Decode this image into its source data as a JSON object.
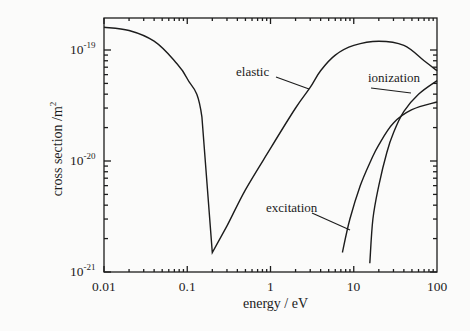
{
  "chart_data": {
    "type": "line",
    "title": "",
    "xlabel": "energy / eV",
    "ylabel": "cross section /m",
    "ylabel_superscript": "2",
    "xscale": "log",
    "yscale": "log",
    "xlim": [
      0.01,
      100
    ],
    "ylim": [
      1e-21,
      1.9e-19
    ],
    "x_ticks": [
      "0.01",
      "0.1",
      "1",
      "10",
      "100"
    ],
    "y_ticks": [
      {
        "base": "10",
        "exp": "-19"
      },
      {
        "base": "10",
        "exp": "-20"
      },
      {
        "base": "10",
        "exp": "-21"
      }
    ],
    "grid": false,
    "legend": "inline annotations",
    "series": [
      {
        "name": "elastic",
        "x": [
          0.01,
          0.02,
          0.04,
          0.07,
          0.1,
          0.15,
          0.2,
          0.3,
          0.5,
          1,
          2,
          3,
          4,
          6,
          10,
          20,
          40,
          70,
          100
        ],
        "y": [
          1.6e-19,
          1.5e-19,
          1.2e-19,
          8e-20,
          5.5e-20,
          2.5e-20,
          1.5e-21,
          2.6e-21,
          5.5e-21,
          1.3e-20,
          3e-20,
          4.6e-20,
          6.5e-20,
          9e-20,
          1.1e-19,
          1.2e-19,
          1.1e-19,
          8e-20,
          6.5e-20
        ]
      },
      {
        "name": "ionization",
        "x": [
          15.6,
          17,
          20,
          25,
          30,
          40,
          60,
          100
        ],
        "y": [
          1.2e-21,
          3e-21,
          6e-21,
          1.2e-20,
          1.8e-20,
          2.8e-20,
          4e-20,
          5.3e-20
        ]
      },
      {
        "name": "excitation",
        "x": [
          7.3,
          9,
          12,
          16,
          20,
          30,
          50,
          100
        ],
        "y": [
          1.5e-21,
          3e-21,
          6e-21,
          1e-20,
          1.4e-20,
          2.2e-20,
          2.9e-20,
          3.4e-20
        ]
      }
    ],
    "annotations": [
      "elastic",
      "ionization",
      "excitation"
    ]
  }
}
